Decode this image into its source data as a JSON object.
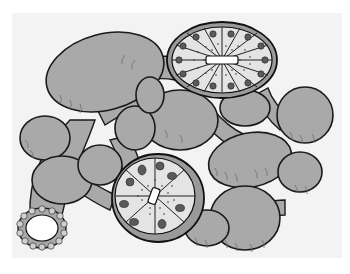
{
  "figure": {
    "background_color": "#f3f3f3",
    "fill_color": "#a9a9a9",
    "outline_color": "#1a1a1a",
    "sectioned_acini": [
      {
        "id": "upper-right-section",
        "cx": 222,
        "cy": 60,
        "rx": 55,
        "ry": 38,
        "cells": 16
      },
      {
        "id": "lower-center-section",
        "cx": 158,
        "cy": 198,
        "rx": 46,
        "ry": 44,
        "cells": 8
      }
    ],
    "duct_opening": {
      "cx": 42,
      "cy": 228,
      "rx": 24,
      "ry": 20
    }
  }
}
